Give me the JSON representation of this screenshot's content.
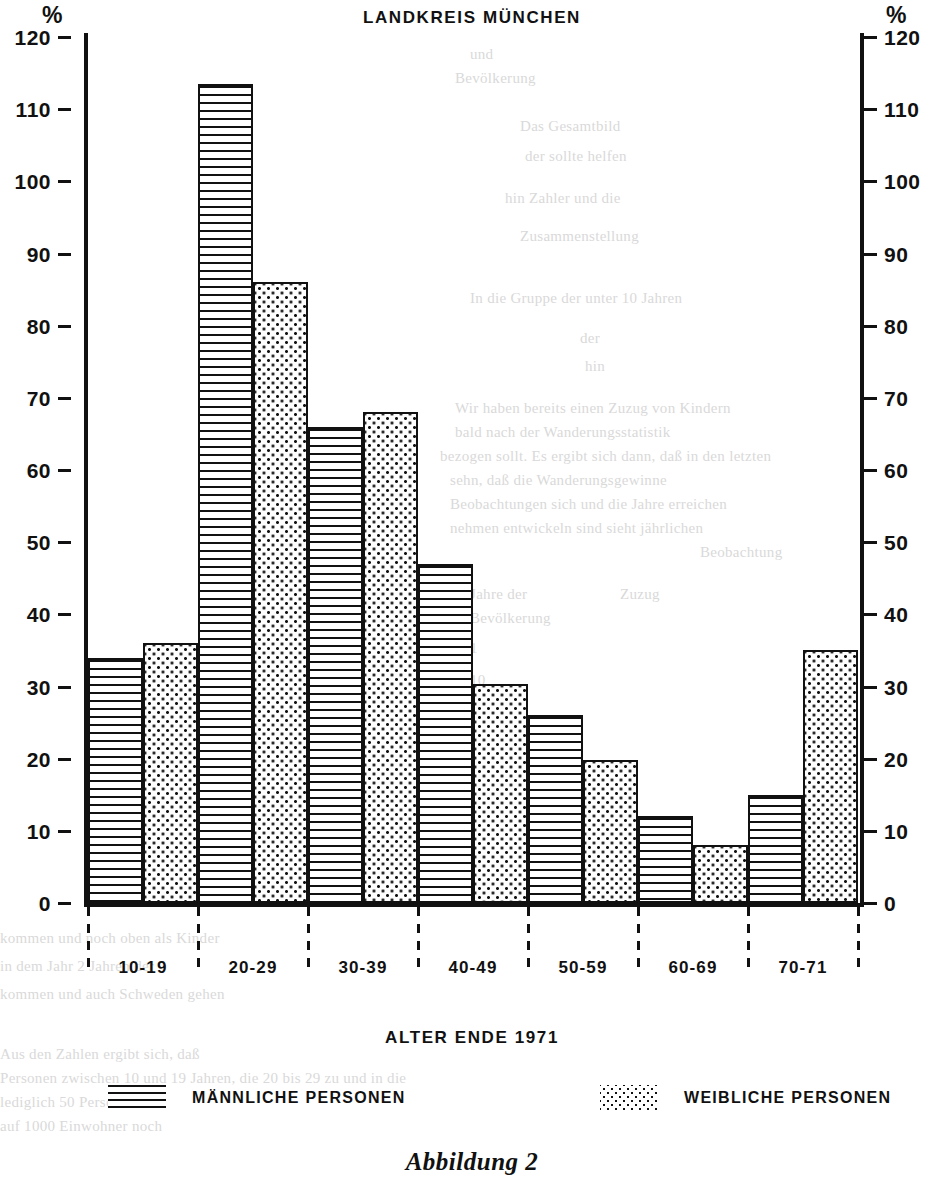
{
  "chart_data": {
    "type": "bar",
    "title": "LANDKREIS MÜNCHEN",
    "xlabel": "ALTER ENDE 1971",
    "ylabel": "%",
    "ylabel_right": "%",
    "ylim": [
      0,
      120
    ],
    "yticks": [
      0,
      10,
      20,
      30,
      40,
      50,
      60,
      70,
      80,
      90,
      100,
      110,
      120
    ],
    "grid": false,
    "legend_position": "bottom",
    "categories": [
      "10-19",
      "20-29",
      "30-39",
      "40-49",
      "50-59",
      "60-69",
      "70-71"
    ],
    "series": [
      {
        "name": "MÄNNLICHE PERSONEN",
        "pattern": "horizontal-lines",
        "values": [
          34,
          113.5,
          66,
          47,
          26,
          12,
          15
        ]
      },
      {
        "name": "WEIBLICHE PERSONEN",
        "pattern": "dots",
        "values": [
          36,
          86,
          68,
          30.3,
          19.8,
          8,
          35
        ]
      }
    ],
    "caption": "Abbildung 2"
  },
  "legend": {
    "male_label": "MÄNNLICHE PERSONEN",
    "female_label": "WEIBLICHE PERSONEN"
  },
  "bleed_text": {
    "l1": "und",
    "l2": "Bevölkerung",
    "l3": "Das Gesamtbild",
    "l4": "der sollte helfen",
    "l5": "hin Zahler und die",
    "l6": "Zusammenstellung",
    "l7": "In die Gruppe der unter 10 Jahren",
    "l8": "der",
    "l9": "hin",
    "l10": "Wir haben bereits einen Zuzug von Kindern",
    "l11": "bald nach der Wanderungsstatistik",
    "l12": "bezogen sollt. Es ergibt sich dann, daß in den letzten",
    "l13": "sehn, daß die Wanderungsgewinne",
    "l14": "Beobachtungen sich und die Jahre erreichen",
    "l15": "nehmen entwickeln sind sieht jährlichen",
    "l16": "Beobachtung",
    "l17": "Jahre der",
    "l18": "Zuzug",
    "l19": "Bevölkerung",
    "l20": "1",
    "l21": "10",
    "l22": "11",
    "l23": "19",
    "l24": "49",
    "l25": "in den letzten Jahren mehr",
    "l26": "kommen und noch oben als Kinder",
    "l27": "in dem Jahr 2 Jahren der",
    "l28": "kommen und auch Schweden gehen",
    "l29": "Aus den Zahlen ergibt sich, daß",
    "l30": "Personen zwischen 10 und 19 Jahren, die 20 bis 29 zu und in die",
    "l31": "lediglich 50 Personen",
    "l32": "auf 1000 Einwohner noch"
  }
}
